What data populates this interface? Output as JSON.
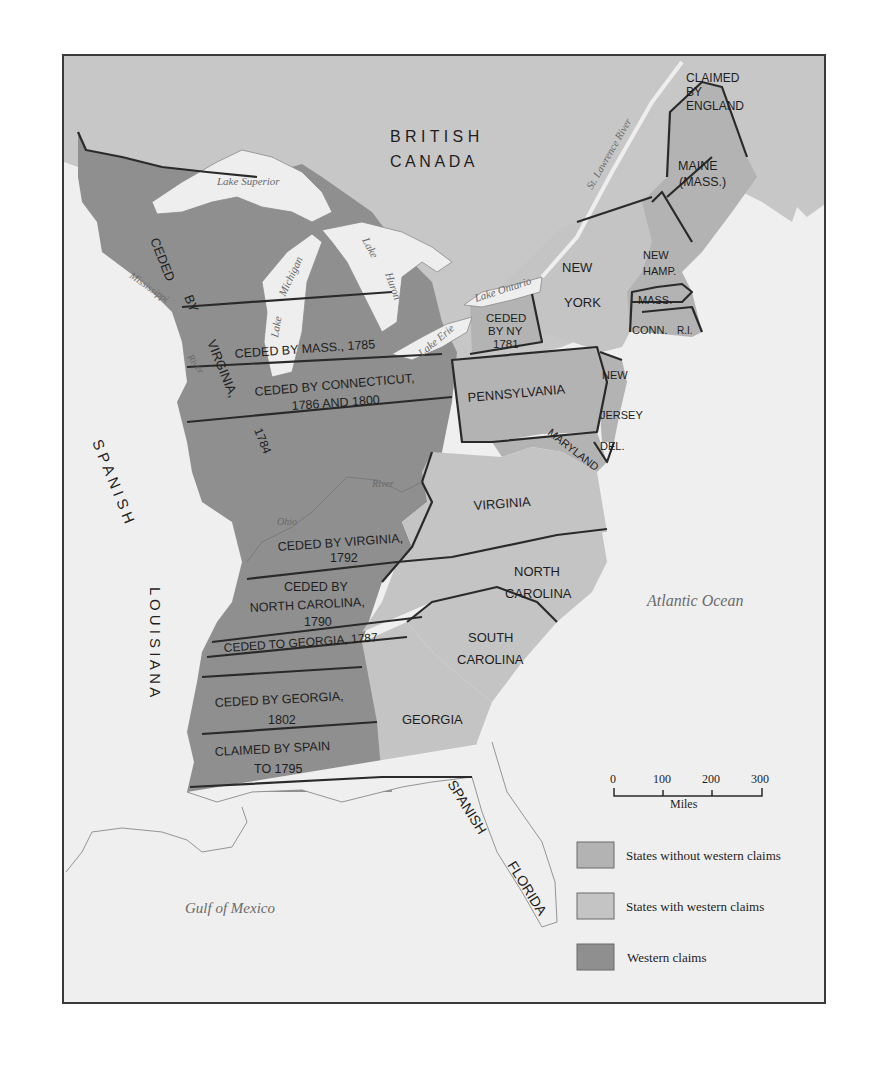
{
  "map": {
    "region_labels": {
      "british_canada_1": "B R I T I S H",
      "british_canada_2": "C A N A D A",
      "spanish_louisiana_1": "S P A N I S H",
      "spanish_louisiana_2": "L O U I S I A N A",
      "spanish_florida_1": "SPANISH",
      "spanish_florida_2": "FLORIDA",
      "claimed_by_england_1": "CLAIMED",
      "claimed_by_england_2": "BY",
      "claimed_by_england_3": "ENGLAND"
    },
    "states": {
      "maine_1": "MAINE",
      "maine_2": "(MASS.)",
      "new_hamp_1": "NEW",
      "new_hamp_2": "HAMP.",
      "mass": "MASS.",
      "conn": "CONN.",
      "ri": "R.I.",
      "new_york_1": "NEW",
      "new_york_2": "YORK",
      "pennsylvania": "PENNSYLVANIA",
      "new_jersey_1": "NEW",
      "new_jersey_2": "JERSEY",
      "delaware": "DEL.",
      "maryland": "MARYLAND",
      "virginia": "VIRGINIA",
      "north_carolina_1": "NORTH",
      "north_carolina_2": "CAROLINA",
      "south_carolina_1": "SOUTH",
      "south_carolina_2": "CAROLINA",
      "georgia": "GEORGIA"
    },
    "western_claims": {
      "ceded_by_virginia_1784_a": "CEDED",
      "ceded_by_virginia_1784_b": "BY",
      "ceded_by_virginia_1784_c": "VIRGINIA,",
      "ceded_by_virginia_1784_d": "1784",
      "ceded_by_mass": "CEDED BY MASS., 1785",
      "ceded_by_conn_1": "CEDED BY CONNECTICUT,",
      "ceded_by_conn_2": "1786 AND 1800",
      "ceded_by_ny_1": "CEDED",
      "ceded_by_ny_2": "BY NY",
      "ceded_by_ny_3": "1781",
      "ceded_by_virginia_1792_1": "CEDED BY VIRGINIA,",
      "ceded_by_virginia_1792_2": "1792",
      "ceded_by_nc_1": "CEDED BY",
      "ceded_by_nc_2": "NORTH CAROLINA,",
      "ceded_by_nc_3": "1790",
      "ceded_to_georgia": "CEDED TO GEORGIA, 1787",
      "ceded_by_georgia_1": "CEDED BY GEORGIA,",
      "ceded_by_georgia_2": "1802",
      "claimed_by_spain_1": "CLAIMED BY SPAIN",
      "claimed_by_spain_2": "TO 1795"
    },
    "water_labels": {
      "lake_superior": "Lake Superior",
      "lake_michigan_1": "Lake",
      "lake_michigan_2": "Michigan",
      "lake_huron_1": "Lake",
      "lake_huron_2": "Huron",
      "lake_ontario": "Lake Ontario",
      "lake_erie": "Lake Erie",
      "st_lawrence": "St. Lawrence River",
      "mississippi_1": "Mississippi",
      "mississippi_2": "River",
      "ohio_1": "Ohio",
      "ohio_2": "River",
      "atlantic": "Atlantic Ocean",
      "gulf": "Gulf of Mexico"
    },
    "scale_bar": {
      "ticks": [
        "0",
        "100",
        "200",
        "300"
      ],
      "unit": "Miles"
    },
    "legend": [
      {
        "label": "States without western claims",
        "color": "#b3b3b3"
      },
      {
        "label": "States with western claims",
        "color": "#c4c4c4"
      },
      {
        "label": "Western claims",
        "color": "#8f8f8f"
      }
    ],
    "colors": {
      "background_sea": "#efefef",
      "foreign_land": "#c7c7c7",
      "lakes": "#eeeeee",
      "states_without": "#b3b3b3",
      "states_with": "#c4c4c4",
      "western_claims": "#8f8f8f",
      "border": "#2a2a2a"
    }
  }
}
